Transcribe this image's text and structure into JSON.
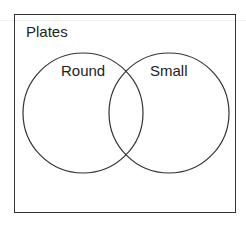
{
  "diagram": {
    "type": "venn",
    "universe_label": "Plates",
    "sets": [
      {
        "label": "Round",
        "cx": 83,
        "cy": 113,
        "r": 60
      },
      {
        "label": "Small",
        "cx": 169,
        "cy": 113,
        "r": 60
      }
    ],
    "stroke_color": "#333333"
  }
}
